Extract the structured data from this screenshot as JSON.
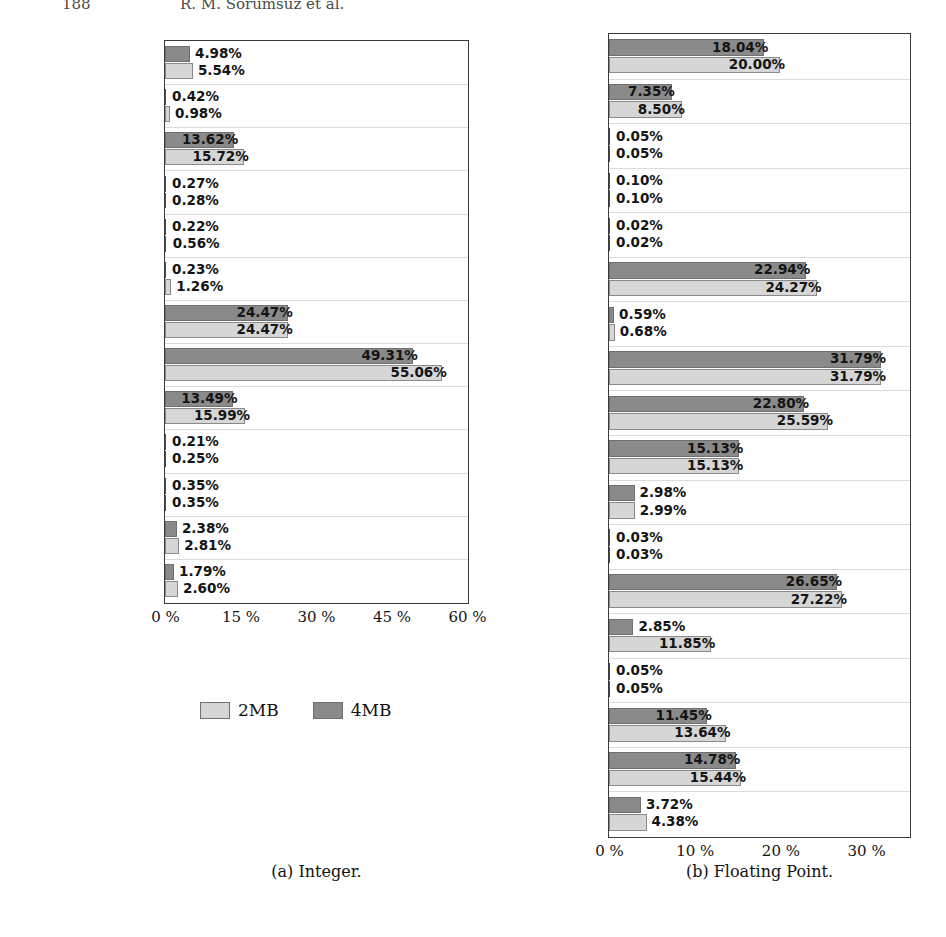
{
  "header": {
    "page_number": "188",
    "running_title": "R. M. Sorumsuz et al."
  },
  "legend": {
    "position": "below-left-panel",
    "entries": [
      {
        "label": "2MB",
        "color": "#d6d6d6"
      },
      {
        "label": "4MB",
        "color": "#8a8a8a"
      }
    ]
  },
  "captions": {
    "left": "(a) Integer.",
    "right": "(b) Floating Point."
  },
  "chart_data": [
    {
      "id": "integer",
      "type": "bar",
      "orientation": "horizontal",
      "title": "(a) Integer.",
      "xlabel": "",
      "ylabel": "",
      "xlim": [
        0,
        60
      ],
      "xticks": [
        0,
        15,
        30,
        45,
        60
      ],
      "xticklabels": [
        "0 %",
        "15 %",
        "30 %",
        "45 %",
        "60 %"
      ],
      "grid": true,
      "legend_position": "below",
      "categories": [
        "astar",
        "bzip2",
        "gcc",
        "gobmk",
        "h264ref",
        "hmmer",
        "libquantum",
        "mcf",
        "omnetpp",
        "perlbench",
        "sjeng",
        "xalancbmk",
        "int-geomean"
      ],
      "category_labels": [
        "astar",
        "bzip2",
        "gcc",
        "gobmk",
        "h264ref",
        "hmmer",
        "libquantum",
        "mcf",
        "omnetpp",
        "perlbench",
        "sjeng",
        "xalancbmk",
        "nt-geomean"
      ],
      "series": [
        {
          "name": "4MB",
          "color": "#8a8a8a",
          "values": [
            4.98,
            0.42,
            13.62,
            0.27,
            0.22,
            0.23,
            24.47,
            49.31,
            13.49,
            0.21,
            0.35,
            2.38,
            1.79
          ],
          "labels": [
            "4.98%",
            "0.42%",
            "13.62%",
            "0.27%",
            "0.22%",
            "0.23%",
            "24.47%",
            "49.31%",
            "13.49%",
            "0.21%",
            "0.35%",
            "2.38%",
            "1.79%"
          ]
        },
        {
          "name": "2MB",
          "color": "#d6d6d6",
          "values": [
            5.54,
            0.98,
            15.72,
            0.28,
            0.56,
            1.26,
            24.47,
            55.06,
            15.99,
            0.25,
            0.35,
            2.81,
            2.6
          ],
          "labels": [
            "5.54%",
            "0.98%",
            "15.72%",
            "0.28%",
            "0.56%",
            "1.26%",
            "24.47%",
            "55.06%",
            "15.99%",
            "0.25%",
            "0.35%",
            "2.81%",
            "2.60%"
          ]
        }
      ]
    },
    {
      "id": "floating-point",
      "type": "bar",
      "orientation": "horizontal",
      "title": "(b) Floating Point.",
      "xlabel": "",
      "ylabel": "",
      "xlim": [
        0,
        35
      ],
      "xticks": [
        0,
        10,
        20,
        30
      ],
      "xticklabels": [
        "0 %",
        "10 %",
        "20 %",
        "30 %"
      ],
      "grid": true,
      "legend_position": "below",
      "categories": [
        "bwaves",
        "cactusADM",
        "calculix",
        "dealII",
        "gamess",
        "GemsFDTD",
        "gromacs",
        "lbm",
        "leslie3d",
        "milc",
        "namd",
        "povray",
        "soplex",
        "sphinx3",
        "tonto",
        "wrf",
        "zeusmp",
        "fp-geomean"
      ],
      "category_labels": [
        "bwaves",
        "cactusADM",
        "calculix",
        "dealII",
        "gamess",
        "GemsFDTD",
        "gromacs",
        "lbm",
        "leslie3d",
        "milc",
        "namd",
        "povray",
        "soplex",
        "sphinx3",
        "tonto",
        "wrf",
        "zeusmp",
        "fp-geomean"
      ],
      "series": [
        {
          "name": "4MB",
          "color": "#8a8a8a",
          "values": [
            18.04,
            7.35,
            0.05,
            0.1,
            0.02,
            22.94,
            0.59,
            31.79,
            22.8,
            15.13,
            2.98,
            0.03,
            26.65,
            2.85,
            0.05,
            11.45,
            14.78,
            3.72
          ],
          "labels": [
            "18.04%",
            "7.35%",
            "0.05%",
            "0.10%",
            "0.02%",
            "22.94%",
            "0.59%",
            "31.79%",
            "22.80%",
            "15.13%",
            "2.98%",
            "0.03%",
            "26.65%",
            "2.85%",
            "0.05%",
            "11.45%",
            "14.78%",
            "3.72%"
          ]
        },
        {
          "name": "2MB",
          "color": "#d6d6d6",
          "values": [
            20.0,
            8.5,
            0.05,
            0.1,
            0.02,
            24.27,
            0.68,
            31.79,
            25.59,
            15.13,
            2.99,
            0.03,
            27.22,
            11.85,
            0.05,
            13.64,
            15.44,
            4.38
          ],
          "labels": [
            "20.00%",
            "8.50%",
            "0.05%",
            "0.10%",
            "0.02%",
            "24.27%",
            "0.68%",
            "31.79%",
            "25.59%",
            "15.13%",
            "2.99%",
            "0.03%",
            "27.22%",
            "11.85%",
            "0.05%",
            "13.64%",
            "15.44%",
            "4.38%"
          ]
        }
      ]
    }
  ]
}
